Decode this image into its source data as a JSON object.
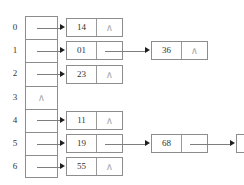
{
  "figure": {
    "null_symbol": "∧",
    "colors": {
      "background": "#ffffff",
      "box_border": "#8d8d8d",
      "connector": "#7e7e7e",
      "arrowhead": "#1f1f1f",
      "text": "#34332f",
      "null_text": "#a8a8a8"
    }
  },
  "table": {
    "bucket_count": 7,
    "indices": [
      "0",
      "1",
      "2",
      "3",
      "4",
      "5",
      "6"
    ]
  },
  "buckets": [
    {
      "index": "0",
      "empty": false,
      "bucket_marker": "",
      "chain": [
        {
          "key": "14",
          "next": "∧",
          "next_is_null": true
        }
      ]
    },
    {
      "index": "1",
      "empty": false,
      "bucket_marker": "",
      "chain": [
        {
          "key": "01",
          "next": "",
          "next_is_null": false
        },
        {
          "key": "36",
          "next": "∧",
          "next_is_null": true
        }
      ]
    },
    {
      "index": "2",
      "empty": false,
      "bucket_marker": "",
      "chain": [
        {
          "key": "23",
          "next": "∧",
          "next_is_null": true
        }
      ]
    },
    {
      "index": "3",
      "empty": true,
      "bucket_marker": "∧",
      "chain": []
    },
    {
      "index": "4",
      "empty": false,
      "bucket_marker": "",
      "chain": [
        {
          "key": "11",
          "next": "∧",
          "next_is_null": true
        }
      ]
    },
    {
      "index": "5",
      "empty": false,
      "bucket_marker": "",
      "chain": [
        {
          "key": "19",
          "next": "",
          "next_is_null": false
        },
        {
          "key": "68",
          "next": "",
          "next_is_null": false
        },
        {
          "key": "82",
          "next": "",
          "next_is_null": false
        }
      ]
    },
    {
      "index": "6",
      "empty": false,
      "bucket_marker": "",
      "chain": [
        {
          "key": "55",
          "next": "∧",
          "next_is_null": true
        }
      ]
    }
  ]
}
